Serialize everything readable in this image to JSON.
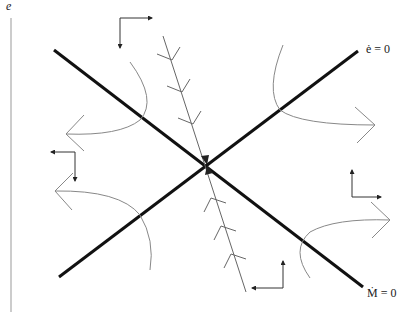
{
  "diagram": {
    "type": "phase-diagram",
    "axis": {
      "y_label": "e"
    },
    "loci": [
      {
        "id": "e_dot_zero",
        "label": "ė = 0",
        "color": "#111111"
      },
      {
        "id": "M_dot_zero",
        "label": "Ṁ = 0",
        "color": "#111111"
      }
    ],
    "saddle_path": {
      "description": "stable arm converging to steady state",
      "color": "#555555"
    },
    "trajectories": 4,
    "direction_arrows": 4,
    "colors": {
      "loci": "#111111",
      "trajectory": "#777777",
      "arrow": "#333333"
    }
  }
}
